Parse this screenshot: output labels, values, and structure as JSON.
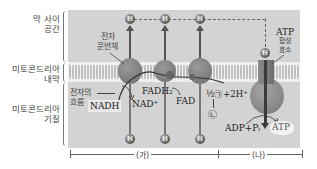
{
  "side_labels": {
    "intermembrane_space": [
      "막 사이",
      "공간"
    ],
    "inner_membrane": [
      "미토콘드리아",
      "내막"
    ],
    "matrix": [
      "미토콘드리아",
      "기질"
    ]
  },
  "diagram": {
    "proton_symbol": "H",
    "electron_carrier_label": [
      "전자",
      "운반체"
    ],
    "electron_flow_label": [
      "전자의",
      "흐름"
    ],
    "nadh": "NADH",
    "nad_plus": "NAD⁺",
    "fadh2": "FADH₂",
    "fad": "FAD",
    "oxygen_reaction": "½㉠+2H⁺",
    "product": "㉡",
    "adp_pi": "ADP+Pᵢ",
    "atp": "ATP",
    "atp_synthase_label": [
      "ATP",
      "합성",
      "효소"
    ]
  },
  "scale": {
    "section_a": "(가)",
    "section_b": "(나)"
  }
}
